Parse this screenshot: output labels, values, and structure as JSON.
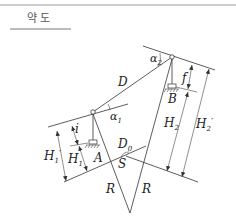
{
  "title": "약 도",
  "colors": {
    "line": "#333333",
    "text": "#222222",
    "title": "#555555",
    "border": "#999999"
  },
  "labels": {
    "D": "D",
    "alpha1": "α",
    "alpha1_sub": "1",
    "alpha2": "α",
    "alpha2_sub": "2",
    "f": "f",
    "B": "B",
    "i": "i",
    "A": "A",
    "D0": "D",
    "D0_sub": "0",
    "S": "S",
    "R_left": "R",
    "R_right": "R",
    "H1": "H",
    "H1_sub": "1",
    "H1p": "H",
    "H1p_sub": "1",
    "H1p_prime": "′",
    "H2": "H",
    "H2_sub": "2",
    "H2p": "H",
    "H2p_sub": "2",
    "H2p_prime": "′"
  }
}
